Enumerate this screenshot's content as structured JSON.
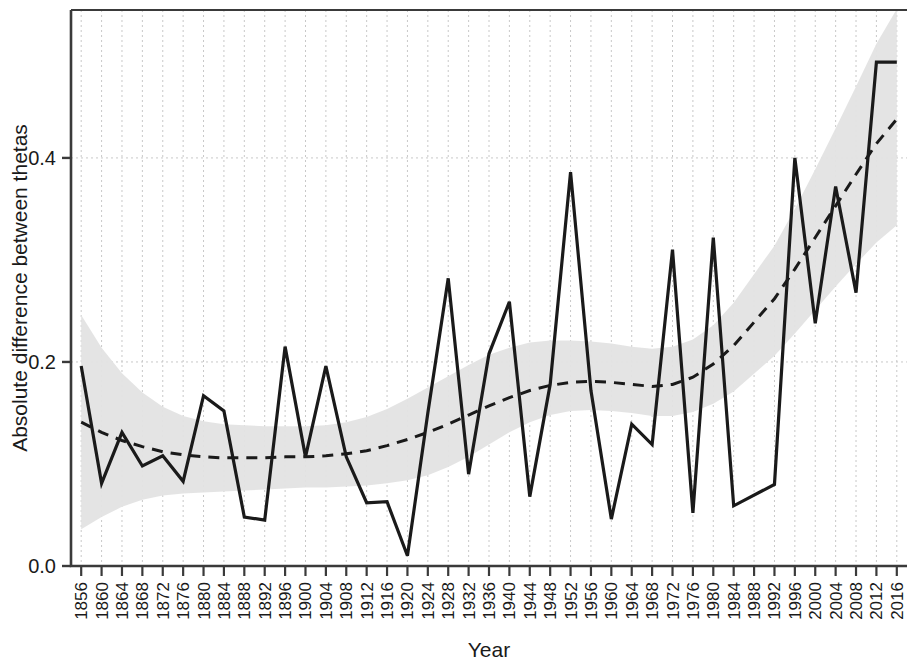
{
  "chart_data": {
    "type": "line",
    "title": "",
    "subtitle": "",
    "xlabel": "Year",
    "ylabel": "Absolute difference between thetas",
    "xlim": [
      1854,
      2018
    ],
    "ylim": [
      0.0,
      0.545
    ],
    "grid": true,
    "legend": "none",
    "y_ticks": [
      "0.0",
      "0.2",
      "0.4"
    ],
    "y_tick_values": [
      0.0,
      0.2,
      0.4
    ],
    "x_ticks": [
      "1856",
      "1860",
      "1864",
      "1868",
      "1872",
      "1876",
      "1880",
      "1884",
      "1888",
      "1892",
      "1896",
      "1900",
      "1904",
      "1908",
      "1912",
      "1916",
      "1920",
      "1924",
      "1928",
      "1932",
      "1936",
      "1940",
      "1944",
      "1948",
      "1952",
      "1956",
      "1960",
      "1964",
      "1968",
      "1972",
      "1976",
      "1980",
      "1984",
      "1988",
      "1992",
      "1996",
      "2000",
      "2004",
      "2008",
      "2012",
      "2016"
    ],
    "x": [
      1856,
      1860,
      1864,
      1868,
      1872,
      1876,
      1880,
      1884,
      1888,
      1892,
      1896,
      1900,
      1904,
      1908,
      1912,
      1916,
      1920,
      1924,
      1928,
      1932,
      1936,
      1940,
      1944,
      1948,
      1952,
      1956,
      1960,
      1964,
      1968,
      1972,
      1976,
      1980,
      1984,
      1992,
      1996,
      2000,
      2004,
      2008,
      2012,
      2016
    ],
    "series": [
      {
        "name": "Absolute difference between thetas",
        "style": "solid",
        "color": "#1a1a1a",
        "values": [
          0.196,
          0.081,
          0.131,
          0.098,
          0.108,
          0.083,
          0.167,
          0.152,
          0.048,
          0.045,
          0.215,
          0.107,
          0.196,
          0.107,
          0.062,
          0.063,
          0.01,
          0.15,
          0.282,
          0.09,
          0.208,
          0.259,
          0.068,
          0.178,
          0.386,
          0.172,
          0.046,
          0.139,
          0.119,
          0.31,
          0.052,
          0.322,
          0.059,
          0.08,
          0.4,
          0.238,
          0.372,
          0.268,
          0.494,
          0.494
        ]
      },
      {
        "name": "Smoothed trend",
        "style": "dashed",
        "color": "#1a1a1a",
        "values": [
          0.141,
          0.131,
          0.123,
          0.117,
          0.112,
          0.109,
          0.107,
          0.106,
          0.106,
          0.106,
          0.107,
          0.107,
          0.108,
          0.11,
          0.113,
          0.118,
          0.124,
          0.131,
          0.139,
          0.148,
          0.157,
          0.165,
          0.172,
          0.177,
          0.18,
          0.181,
          0.18,
          0.178,
          0.176,
          0.178,
          0.185,
          0.198,
          0.216,
          0.262,
          0.291,
          0.322,
          0.353,
          0.384,
          0.414,
          0.438
        ]
      }
    ],
    "confidence_band": {
      "name": "95% confidence interval",
      "color": "#e0e0e0",
      "lower": [
        0.036,
        0.048,
        0.058,
        0.065,
        0.069,
        0.071,
        0.072,
        0.073,
        0.074,
        0.075,
        0.076,
        0.077,
        0.077,
        0.078,
        0.079,
        0.081,
        0.084,
        0.089,
        0.097,
        0.107,
        0.119,
        0.131,
        0.141,
        0.148,
        0.152,
        0.153,
        0.152,
        0.15,
        0.147,
        0.147,
        0.151,
        0.159,
        0.171,
        0.206,
        0.228,
        0.251,
        0.274,
        0.296,
        0.317,
        0.334
      ],
      "upper": [
        0.246,
        0.214,
        0.189,
        0.17,
        0.156,
        0.147,
        0.142,
        0.139,
        0.138,
        0.137,
        0.137,
        0.137,
        0.138,
        0.141,
        0.146,
        0.154,
        0.164,
        0.175,
        0.186,
        0.197,
        0.207,
        0.214,
        0.219,
        0.221,
        0.221,
        0.22,
        0.218,
        0.215,
        0.213,
        0.215,
        0.222,
        0.236,
        0.258,
        0.314,
        0.35,
        0.389,
        0.429,
        0.47,
        0.512,
        0.546
      ]
    }
  }
}
